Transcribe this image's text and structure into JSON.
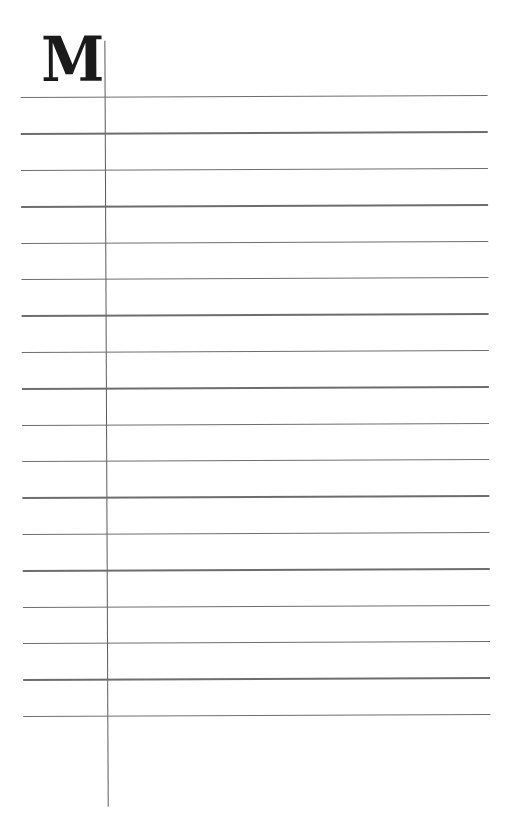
{
  "page": {
    "initial_letter": "M",
    "ruled_line_count": 18,
    "line_color": "#6d6d6d",
    "margin_line_color": "#5a5a5a"
  }
}
